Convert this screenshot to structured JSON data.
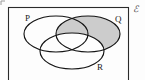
{
  "figure": {
    "type": "venn-diagram",
    "set_count": 3,
    "universe_symbol": "ℰ",
    "background_color": "#fdfdfd",
    "outline_color": "#141414",
    "shade_color": "#cccccc",
    "frame_color": "#2a2a2a"
  },
  "sets": [
    {
      "id": "P",
      "label": "P",
      "label_x": 25,
      "label_y": 21,
      "cx": 56,
      "cy": 34,
      "rx": 32,
      "ry": 18
    },
    {
      "id": "Q",
      "label": "Q",
      "label_x": 115,
      "label_y": 22,
      "cx": 88,
      "cy": 34,
      "rx": 32,
      "ry": 18
    },
    {
      "id": "R",
      "label": "R",
      "label_x": 97,
      "label_y": 70,
      "cx": 72,
      "cy": 51,
      "rx": 32,
      "ry": 18
    }
  ],
  "shaded_region": {
    "description": "Q minus R",
    "expression": "Q \\ R",
    "fill": "#cccccc"
  },
  "universe": {
    "symbol": "ℰ",
    "x": 133,
    "y": 12,
    "frame": {
      "x": 8,
      "y": 7,
      "width": 120,
      "height": 76
    }
  }
}
